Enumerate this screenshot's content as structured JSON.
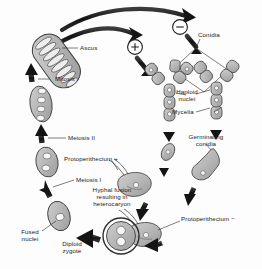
{
  "figure": {
    "organism": "Neurospora",
    "style": "grayscale line drawing with thick black curved arrows",
    "background_color": "#fdfdfd",
    "ink_color": "#1a1a1a",
    "cell_fill": "#b9b9b9",
    "cell_stroke": "#3a3a3a",
    "nucleus_fill": "#f2f2f2"
  },
  "labels": {
    "ascus": "Ascus",
    "mitosis": "Mitosis",
    "meiosis_2": "Meiosis II",
    "meiosis_1": "Meiosis I",
    "fused_nuclei": "Fused\nnuclei",
    "diploid_zygote": "Diploid\nzygote",
    "hyphal_fusion": "Hyphal fusion\nresulting in\nheterocaryon",
    "protoperithecium_plus": "Protoperithecium +",
    "protoperithecium_minus": "Protoperithecium −",
    "conidia": "Conidia",
    "haploid_nuclei": "Haploid\nnuclei",
    "mycelia": "Mycelia",
    "germinating_conidia": "Germinating\nconidia",
    "mating_type_plus": "+",
    "mating_type_minus": "−"
  },
  "structures": [
    {
      "name": "ascus",
      "description": "elongated tilted sac containing eight ascospores",
      "spore_count": 8
    },
    {
      "name": "post-mitosis-cell",
      "description": "oval cell with four nuclei in a row",
      "nuclei": 4
    },
    {
      "name": "meiosis-II-cell",
      "description": "oval cell with two nuclei",
      "nuclei": 2
    },
    {
      "name": "meiosis-I-cell",
      "description": "oval cell with one nucleus",
      "nuclei": 1
    },
    {
      "name": "diploid-zygote",
      "description": "oval cell with single fused diploid nucleus",
      "nuclei": 1
    },
    {
      "name": "heterocaryon",
      "description": "large circular cell with two haploid nuclei",
      "nuclei": 2
    },
    {
      "name": "mycelium-plus",
      "description": "branched hyphal filament, mating type plus"
    },
    {
      "name": "mycelium-minus",
      "description": "branched hyphal filament, mating type minus"
    },
    {
      "name": "conidium-plus",
      "description": "small detached asexual spore, plus type"
    },
    {
      "name": "germinating-conidium",
      "description": "conidium with emerging germ tube"
    },
    {
      "name": "protoperithecium-plus",
      "description": "female structure with trichogyne, plus type"
    },
    {
      "name": "protoperithecium-minus",
      "description": "female structure with trichogyne, minus type"
    }
  ],
  "cycle_steps": [
    "Mycelia (+ and −) produce conidia",
    "Conidia germinate",
    "Germinating conidia fuse with protoperithecium of opposite mating type",
    "Hyphal fusion resulting in heterocaryon",
    "Fused nuclei form diploid zygote",
    "Meiosis I",
    "Meiosis II",
    "Mitosis",
    "Ascus with eight ascospores",
    "Ascospores regenerate mycelia"
  ]
}
